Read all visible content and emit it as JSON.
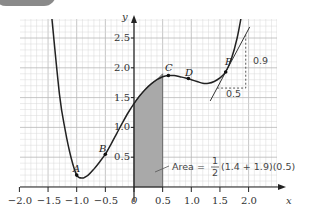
{
  "chart_data": {
    "type": "line",
    "title": "",
    "xlabel": "x",
    "ylabel": "y",
    "xlim": [
      -2.0,
      2.4
    ],
    "ylim": [
      0,
      2.9
    ],
    "grid": true,
    "x_ticks": [
      "−2.0",
      "−1.5",
      "−1.0",
      "−0.5",
      "0",
      "0.5",
      "1.0",
      "1.5",
      "2.0"
    ],
    "x_tick_values": [
      -2.0,
      -1.5,
      -1.0,
      -0.5,
      0,
      0.5,
      1.0,
      1.5,
      2.0
    ],
    "y_ticks": [
      "0.5",
      "1.0",
      "1.5",
      "2.0",
      "2.5"
    ],
    "y_tick_values": [
      0.5,
      1.0,
      1.5,
      2.0,
      2.5
    ],
    "series": [
      {
        "name": "curve",
        "x": [
          -1.45,
          -1.3,
          -1.2,
          -1.1,
          -1.0,
          -0.9,
          -0.8,
          -0.7,
          -0.6,
          -0.5,
          -0.4,
          -0.3,
          -0.2,
          -0.1,
          0.0,
          0.1,
          0.2,
          0.3,
          0.4,
          0.5,
          0.6,
          0.7,
          0.8,
          0.9,
          1.0,
          1.1,
          1.2,
          1.3,
          1.4,
          1.5,
          1.6,
          1.7,
          1.8,
          1.88
        ],
        "y": [
          3.0,
          1.55,
          0.95,
          0.5,
          0.2,
          0.15,
          0.2,
          0.3,
          0.42,
          0.55,
          0.72,
          0.9,
          1.08,
          1.25,
          1.4,
          1.53,
          1.64,
          1.73,
          1.8,
          1.85,
          1.87,
          1.87,
          1.85,
          1.83,
          1.8,
          1.77,
          1.74,
          1.74,
          1.77,
          1.83,
          1.93,
          2.15,
          2.5,
          2.9
        ]
      }
    ],
    "points": [
      {
        "label": "A",
        "x": -1.0,
        "y": 0.2
      },
      {
        "label": "B",
        "x": -0.5,
        "y": 0.55
      },
      {
        "label": "C",
        "x": 0.6,
        "y": 1.87
      },
      {
        "label": "D",
        "x": 0.95,
        "y": 1.82
      },
      {
        "label": "P",
        "x": 1.6,
        "y": 1.93
      }
    ],
    "shaded_region": {
      "x_from": 0,
      "x_to": 0.5,
      "y_left": 1.4,
      "y_right": 1.9,
      "type": "trapezium"
    },
    "tangent": {
      "through": "P",
      "run": 0.5,
      "rise": 0.9,
      "run_label": "0.5",
      "rise_label": "0.9"
    },
    "annotations": [
      {
        "text": "Area = ½(1.4 + 1.9)(0.5)",
        "prefix": "Area =",
        "frac_num": "1",
        "frac_den": "2",
        "suffix": "(1.4 + 1.9)(0.5)"
      }
    ]
  },
  "labels": {
    "x_axis": "x",
    "y_axis": "y",
    "origin": "0",
    "x_ticks": [
      "−2.0",
      "−1.5",
      "−1.0",
      "−0.5",
      "0.5",
      "1.0",
      "1.5",
      "2.0"
    ],
    "y_ticks": [
      "0.5",
      "1.0",
      "1.5",
      "2.0",
      "2.5"
    ],
    "points": [
      "A",
      "B",
      "C",
      "D",
      "P"
    ],
    "rise": "0.9",
    "run": "0.5",
    "area_prefix": "Area =",
    "frac_num": "1",
    "frac_den": "2",
    "area_suffix": "(1.4 + 1.9)(0.5)"
  }
}
